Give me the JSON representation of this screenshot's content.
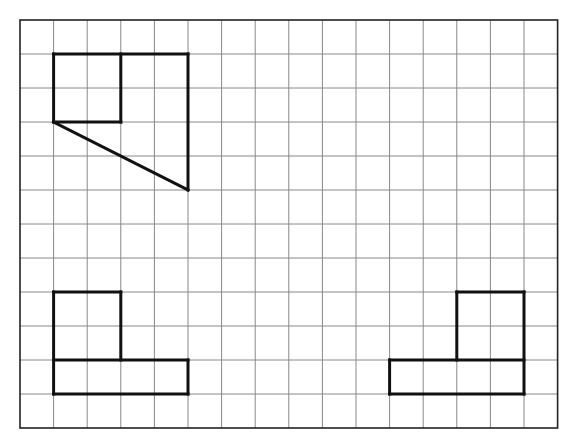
{
  "grid": {
    "origin_x": 20,
    "origin_y": 20,
    "cols": 16,
    "rows": 12,
    "cell_w": 33.6,
    "cell_h": 34.0,
    "line_color": "#888888",
    "border_color": "#222222",
    "shape_color": "#111111"
  },
  "shapes": [
    {
      "name": "top-left-figure",
      "segments": [
        [
          [
            1,
            1
          ],
          [
            5,
            1
          ]
        ],
        [
          [
            1,
            1
          ],
          [
            1,
            3
          ]
        ],
        [
          [
            1,
            3
          ],
          [
            3,
            3
          ]
        ],
        [
          [
            3,
            1
          ],
          [
            3,
            3
          ]
        ],
        [
          [
            5,
            1
          ],
          [
            5,
            5
          ]
        ],
        [
          [
            1,
            3
          ],
          [
            5,
            5
          ]
        ]
      ]
    },
    {
      "name": "bottom-left-figure",
      "segments": [
        [
          [
            1,
            8
          ],
          [
            3,
            8
          ]
        ],
        [
          [
            1,
            8
          ],
          [
            1,
            11
          ]
        ],
        [
          [
            3,
            8
          ],
          [
            3,
            10
          ]
        ],
        [
          [
            1,
            10
          ],
          [
            5,
            10
          ]
        ],
        [
          [
            5,
            10
          ],
          [
            5,
            11
          ]
        ],
        [
          [
            1,
            11
          ],
          [
            5,
            11
          ]
        ]
      ]
    },
    {
      "name": "bottom-right-figure",
      "segments": [
        [
          [
            13,
            8
          ],
          [
            15,
            8
          ]
        ],
        [
          [
            13,
            8
          ],
          [
            13,
            10
          ]
        ],
        [
          [
            15,
            8
          ],
          [
            15,
            11
          ]
        ],
        [
          [
            11,
            10
          ],
          [
            15,
            10
          ]
        ],
        [
          [
            11,
            10
          ],
          [
            11,
            11
          ]
        ],
        [
          [
            11,
            11
          ],
          [
            15,
            11
          ]
        ]
      ]
    }
  ]
}
